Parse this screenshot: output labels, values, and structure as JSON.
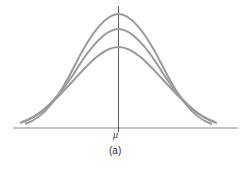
{
  "figure": {
    "axis_label": "μ",
    "caption": "(a)"
  },
  "curves": [
    {
      "name": "tallest-curve",
      "peak_y": 14
    },
    {
      "name": "middle-curve",
      "peak_y": 29
    },
    {
      "name": "shortest-curve",
      "peak_y": 47
    }
  ],
  "colors": {
    "curve": "#9a9a9a",
    "axis": "#555555"
  }
}
